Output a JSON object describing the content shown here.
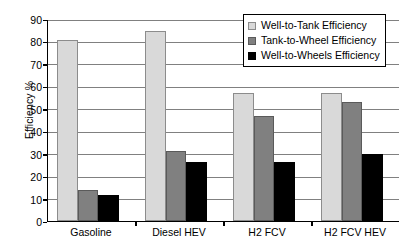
{
  "chart_data": {
    "type": "bar",
    "title": "",
    "xlabel": "",
    "ylabel": "Efficiency %",
    "ylim": [
      0,
      90
    ],
    "ytick_step": 10,
    "yticks": [
      0,
      10,
      20,
      30,
      40,
      50,
      60,
      70,
      80,
      90
    ],
    "grid": "horizontal",
    "legend_position": "top-right",
    "categories": [
      "Gasoline",
      "Diesel  HEV",
      "H2 FCV",
      "H2 FCV HEV"
    ],
    "series": [
      {
        "name": "Well-to-Tank Efficiency",
        "color": "#d9d9d9",
        "values": [
          80.5,
          84.5,
          57,
          57
        ]
      },
      {
        "name": "Tank-to-Wheel Efficiency",
        "color": "#808080",
        "values": [
          14,
          31,
          47,
          53
        ]
      },
      {
        "name": "Well-to-Wheels Efficiency",
        "color": "#000000",
        "values": [
          11.5,
          26.5,
          26.5,
          30
        ]
      }
    ]
  }
}
